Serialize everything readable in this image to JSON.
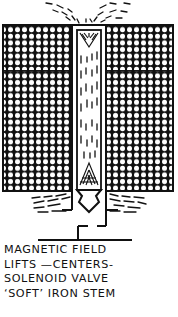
{
  "figure": {
    "colors": {
      "ink": "#111111",
      "paper": "#ffffff"
    },
    "parts": [
      "left-coil-winding",
      "right-coil-winding",
      "soft-iron-stem",
      "valve-tip",
      "field-lines-top",
      "field-lines-bottom",
      "valve-seat"
    ]
  },
  "caption": {
    "lines": [
      "MAGNETIC FIELD",
      "LIFTS —CENTERS-",
      "SOLENOID VALVE",
      "‘SOFT’ IRON STEM"
    ]
  }
}
